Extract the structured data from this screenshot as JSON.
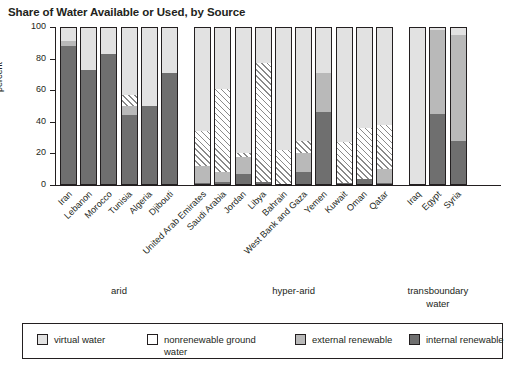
{
  "chart_data": {
    "type": "bar",
    "title": "Share of Water Available or Used, by Source",
    "xlabel": "",
    "ylabel": "percent",
    "ylim": [
      0,
      100
    ],
    "yticks": [
      0,
      20,
      40,
      60,
      80,
      100
    ],
    "stacked": true,
    "grid": false,
    "legend_position": "bottom",
    "categories": [
      "Iran",
      "Lebanon",
      "Morocco",
      "Tunisia",
      "Algeria",
      "Djibouti",
      "United Arab Emirates",
      "Saudi Arabia",
      "Jordan",
      "Libya",
      "Bahrain",
      "West Bank and Gaza",
      "Yemen",
      "Kuwait",
      "Oman",
      "Qatar",
      "Iraq",
      "Egypt",
      "Syria"
    ],
    "groups": [
      {
        "label": "arid",
        "label2": "",
        "categories": [
          "Iran",
          "Lebanon",
          "Morocco",
          "Tunisia",
          "Algeria",
          "Djibouti"
        ]
      },
      {
        "label": "hyper-arid",
        "label2": "",
        "categories": [
          "United Arab Emirates",
          "Saudi Arabia",
          "Jordan",
          "Libya",
          "Bahrain",
          "West Bank and Gaza",
          "Yemen",
          "Kuwait",
          "Oman",
          "Qatar"
        ]
      },
      {
        "label": "transboundary",
        "label2": "water",
        "categories": [
          "Iraq",
          "Egypt",
          "Syria"
        ]
      }
    ],
    "series": [
      {
        "name": "internal renewable",
        "color": "#6f6f6f",
        "values": [
          88,
          73,
          83,
          44,
          50,
          71,
          1,
          2,
          7,
          2,
          0,
          8,
          46,
          1,
          4,
          1,
          0,
          45,
          28
        ]
      },
      {
        "name": "external renewable",
        "color": "#b9b9b9",
        "values": [
          3,
          0,
          0,
          6,
          0,
          0,
          11,
          6,
          11,
          0,
          0,
          12,
          25,
          0,
          0,
          9,
          0,
          53,
          67
        ]
      },
      {
        "name": "nonrenewable ground water",
        "color": "#ffffff",
        "hatched": true,
        "values": [
          0,
          0,
          0,
          7,
          0,
          0,
          22,
          53,
          2,
          75,
          22,
          8,
          0,
          26,
          32,
          28,
          0,
          0,
          0
        ]
      },
      {
        "name": "virtual water",
        "color": "#e2e2e2",
        "values": [
          9,
          27,
          17,
          43,
          50,
          29,
          66,
          39,
          80,
          23,
          78,
          72,
          29,
          73,
          64,
          62,
          100,
          2,
          5
        ]
      }
    ]
  },
  "legend": {
    "items": [
      {
        "label": "virtual water",
        "swatch": "virtual"
      },
      {
        "label": "nonrenewable ground",
        "label2": "water",
        "swatch": "nonren"
      },
      {
        "label": "external renewable",
        "swatch": "external"
      },
      {
        "label": "internal renewable",
        "swatch": "internal"
      }
    ]
  }
}
